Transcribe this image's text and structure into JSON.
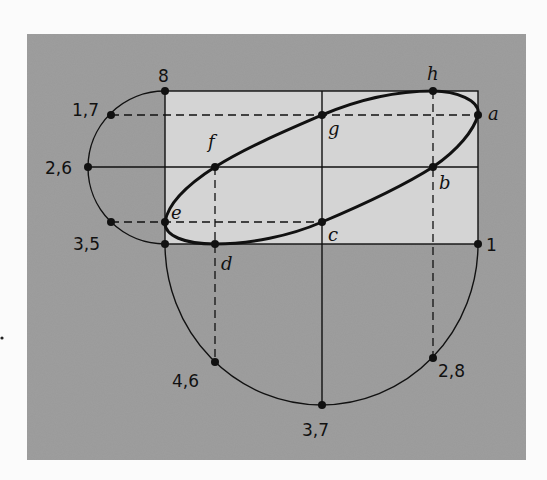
{
  "diagram": {
    "title": "",
    "colors": {
      "page_bg": "#fbfbfb",
      "panel_bg": "#9e9e9e",
      "rect_fill": "#d4d4d4",
      "stroke": "#111111"
    },
    "panel": {
      "x": 27,
      "y": 34,
      "w": 499,
      "h": 426
    },
    "rectangle": {
      "x": 165,
      "y": 91,
      "w": 313,
      "h": 153
    },
    "ellipse_points": {
      "a": {
        "label": "a",
        "x": 478,
        "y": 115
      },
      "b": {
        "label": "b",
        "x": 433,
        "y": 167
      },
      "c": {
        "label": "c",
        "x": 322,
        "y": 222
      },
      "d": {
        "label": "d",
        "x": 215,
        "y": 244
      },
      "e": {
        "label": "e",
        "x": 165,
        "y": 222
      },
      "f": {
        "label": "f",
        "x": 215,
        "y": 167
      },
      "g": {
        "label": "g",
        "x": 322,
        "y": 115
      },
      "h": {
        "label": "h",
        "x": 433,
        "y": 91
      }
    },
    "number_labels": {
      "n8": "8",
      "n17": "1,7",
      "n26": "2,6",
      "n35": "3,5",
      "n1": "1",
      "n46": "4,6",
      "n37": "3,7",
      "n28": "2,8"
    }
  }
}
